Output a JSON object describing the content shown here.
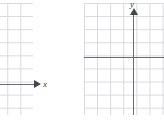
{
  "figure": {
    "name": "coordinate-grid-pair",
    "background_color": "#ffffff",
    "width": 164,
    "height": 121
  },
  "style": {
    "grid_line_color": "#d8d8dd",
    "axis_color": "#6b6b72",
    "arrow_color": "#46464d",
    "label_color": "#3a3a40",
    "grid_cell_px": 13.1
  },
  "panels": [
    {
      "id": "panel-left",
      "name": "left-coordinate-grid",
      "clipped": true,
      "grid": {
        "visible": true,
        "columns": 5,
        "rows": 9
      },
      "axes": [
        {
          "orientation": "horizontal",
          "label": "x",
          "arrowhead": "right"
        }
      ]
    },
    {
      "id": "panel-right",
      "name": "right-coordinate-grid",
      "clipped": false,
      "grid": {
        "visible": true,
        "columns": 6,
        "rows": 9
      },
      "axes": [
        {
          "orientation": "horizontal",
          "label": "",
          "arrowhead": "none"
        },
        {
          "orientation": "vertical",
          "label": "y",
          "arrowhead": "up"
        }
      ]
    }
  ],
  "labels": {
    "x_axis": "x",
    "y_axis": "y"
  },
  "chart_data": {
    "type": "line",
    "title": "",
    "subtitle": "",
    "xlabel": "x",
    "ylabel": "y",
    "grid": true,
    "legend": "none",
    "series": [],
    "annotations": [
      {
        "text": "x",
        "target": "left-panel-horizontal-axis"
      },
      {
        "text": "y",
        "target": "right-panel-vertical-axis"
      }
    ]
  }
}
